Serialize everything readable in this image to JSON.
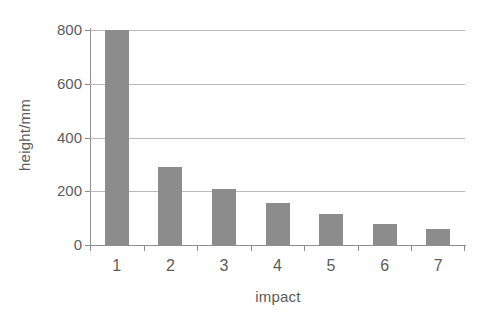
{
  "chart_data": {
    "type": "bar",
    "title": "",
    "subtitle": "",
    "xlabel": "impact",
    "ylabel": "height/mm",
    "categories": [
      "1",
      "2",
      "3",
      "4",
      "5",
      "6",
      "7"
    ],
    "values": [
      800,
      290,
      210,
      155,
      115,
      80,
      60
    ],
    "series": [
      {
        "name": "height",
        "values": [
          800,
          290,
          210,
          155,
          115,
          80,
          60
        ]
      }
    ],
    "ylim": [
      0,
      800
    ],
    "yticks": [
      0,
      200,
      400,
      600,
      800
    ],
    "ytick_labels": [
      "0",
      "200",
      "400",
      "600",
      "800"
    ],
    "xtick_labels": [
      "1",
      "2",
      "3",
      "4",
      "5",
      "6",
      "7"
    ],
    "grid": true,
    "grid_axis": "y",
    "legend": false,
    "legend_position": "none",
    "bar_color": "#8c8c8c",
    "axis_color": "#8f8f8f",
    "grid_color": "#adadad",
    "text_color": "#5c5c5c",
    "background_color": "#ffffff",
    "annotations": []
  }
}
